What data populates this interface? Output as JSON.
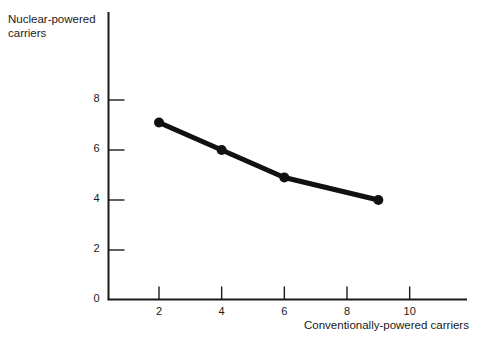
{
  "chart_data": {
    "type": "line",
    "title": "",
    "xlabel": "Conventionally-powered carriers",
    "ylabel": "Nuclear-powered carriers",
    "xlim": [
      0,
      11.8
    ],
    "ylim": [
      0,
      11.5
    ],
    "xticks": [
      2,
      4,
      6,
      8,
      10
    ],
    "xtick_labels": [
      "2",
      "4",
      "6",
      "8",
      "10"
    ],
    "yticks": [
      0,
      2,
      4,
      6,
      8
    ],
    "ytick_labels": [
      "0",
      "2",
      "4",
      "6",
      "8"
    ],
    "grid": false,
    "legend": null,
    "tick_direction": "in",
    "series": [
      {
        "name": "carriers-tradeoff",
        "color": "#111111",
        "line_width": 5,
        "marker": "circle",
        "marker_size": 10,
        "x": [
          2,
          4,
          6,
          9
        ],
        "y": [
          7.1,
          6.0,
          4.9,
          4.0
        ],
        "points": [
          {
            "x": 2,
            "y": 7.1
          },
          {
            "x": 4,
            "y": 6.0
          },
          {
            "x": 6,
            "y": 4.9
          },
          {
            "x": 9,
            "y": 4.0
          }
        ]
      }
    ],
    "axis_color": "#1a1a1a",
    "background": "#ffffff"
  },
  "axes": {
    "y_axis_label_line1": "Nuclear-powered",
    "y_axis_label_line2": "carriers",
    "x_axis_label": "Conventionally-powered carriers"
  }
}
